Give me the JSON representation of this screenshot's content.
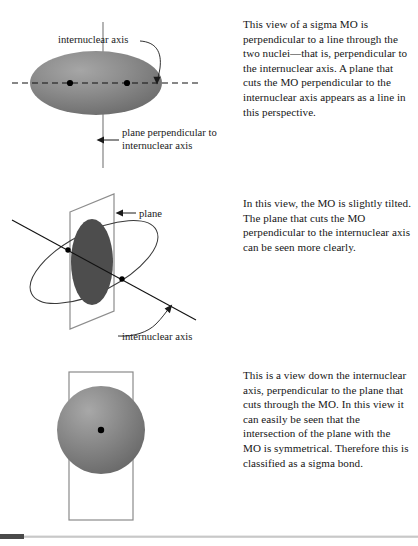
{
  "document": {
    "title": "Sigma MO perpendicular plane views",
    "background_color": "#ffffff",
    "text_color": "#161616"
  },
  "colors": {
    "mo_fill_light": "#9a9a9a",
    "mo_fill_dark": "#6b6b6b",
    "intersection_fill": "#4d4d4d",
    "line_color": "#8a8a8a",
    "outline_color": "#3a3a3a",
    "nucleus_color": "#000000",
    "rule_dark": "#4a4a4a",
    "rule_light": "#c8c8c8"
  },
  "panels": [
    {
      "id": "panel-perpendicular-view",
      "figure": {
        "name": "sigma-mo-edge-on-diagram",
        "shape": "ellipse",
        "nuclei_count": 2,
        "labels": [
          {
            "name": "internuclear-axis-label",
            "text": "internuclear axis",
            "leader": "curved-leader-to-dashed-axis"
          },
          {
            "name": "plane-perpendicular-label",
            "text": "plane perpendicular to internuclear axis",
            "line1": "plane perpendicular to",
            "line2": "internuclear axis",
            "leader": "left-arrow-to-vertical-line"
          }
        ]
      },
      "caption": "This view of a sigma MO is perpendicular to a line through the two nuclei—that is, perpendicular to the internuclear axis. A plane that cuts the MO perpendicular to the internuclear axis appears as a line in this perspective."
    },
    {
      "id": "panel-tilted-view",
      "figure": {
        "name": "sigma-mo-tilted-diagram",
        "shape": "tilted-ellipse-with-cutting-plane",
        "nuclei_count": 2,
        "labels": [
          {
            "name": "plane-label",
            "text": "plane",
            "leader": "left-arrow-to-plane"
          },
          {
            "name": "internuclear-axis-label",
            "text": "internuclear axis",
            "leader": "curved-leader-to-axis-line"
          }
        ]
      },
      "caption": "In this view, the MO is slightly tilted. The plane that cuts the MO perpendicular to the internuclear axis can be seen more clearly."
    },
    {
      "id": "panel-axial-view",
      "figure": {
        "name": "sigma-mo-down-axis-diagram",
        "shape": "sphere-in-rectangle",
        "nuclei_count": 1,
        "labels": []
      },
      "caption": "This is a view down the internuclear axis, perpendicular to the plane that cuts through the MO. In this view it can easily be seen that the intersection of the plane with the MO is symmetrical. Therefore this is classified as a sigma bond."
    }
  ]
}
